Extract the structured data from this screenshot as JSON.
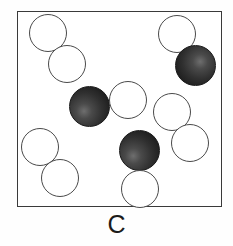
{
  "figure": {
    "label": "C",
    "width": 233,
    "height": 246,
    "background_color": "#fefefe",
    "watermark_text": "chemistry",
    "watermark_color": "#d9d9d9"
  },
  "container": {
    "name": "reaction-vessel",
    "x": 17,
    "y": 11,
    "width": 205,
    "height": 196,
    "border_color": "#3a3a3a",
    "border_width": 1.6,
    "fill_color": "#ffffff"
  },
  "legend": {
    "open_circle_label": "open circle",
    "shaded_sphere_label": "shaded sphere",
    "open_fill": "#ffffff",
    "open_stroke": "#4a4a4a",
    "shaded_fill": "#2b2b2b",
    "shaded_stroke": "#1a1a1a"
  },
  "counts": {
    "open_circles": 9,
    "shaded_spheres": 4,
    "total_particles": 13
  },
  "particles": [
    {
      "id": 1,
      "type": "open",
      "cx": 48,
      "cy": 33,
      "r": 19,
      "highlight": null
    },
    {
      "id": 2,
      "type": "open",
      "cx": 67,
      "cy": 64,
      "r": 19,
      "highlight": null
    },
    {
      "id": 3,
      "type": "open",
      "cx": 177,
      "cy": 34,
      "r": 19,
      "highlight": null
    },
    {
      "id": 4,
      "type": "shaded",
      "cx": 195,
      "cy": 65,
      "r": 20.5,
      "highlight": "62% 40%"
    },
    {
      "id": 5,
      "type": "shaded",
      "cx": 89,
      "cy": 106,
      "r": 20.5,
      "highlight": "36% 62%"
    },
    {
      "id": 6,
      "type": "open",
      "cx": 128,
      "cy": 100,
      "r": 19,
      "highlight": null
    },
    {
      "id": 7,
      "type": "open",
      "cx": 172,
      "cy": 112,
      "r": 19,
      "highlight": null
    },
    {
      "id": 8,
      "type": "open",
      "cx": 190,
      "cy": 143,
      "r": 19,
      "highlight": null
    },
    {
      "id": 9,
      "type": "shaded",
      "cx": 139,
      "cy": 150,
      "r": 20.5,
      "highlight": "34% 64%"
    },
    {
      "id": 10,
      "type": "open",
      "cx": 40,
      "cy": 147,
      "r": 19,
      "highlight": null
    },
    {
      "id": 11,
      "type": "open",
      "cx": 60,
      "cy": 178,
      "r": 19,
      "highlight": null
    },
    {
      "id": 12,
      "type": "open",
      "cx": 140,
      "cy": 189,
      "r": 19,
      "highlight": null
    },
    {
      "id": 13,
      "type": "shaded",
      "cx": 0,
      "cy": 0,
      "r": 0,
      "highlight": null
    }
  ]
}
